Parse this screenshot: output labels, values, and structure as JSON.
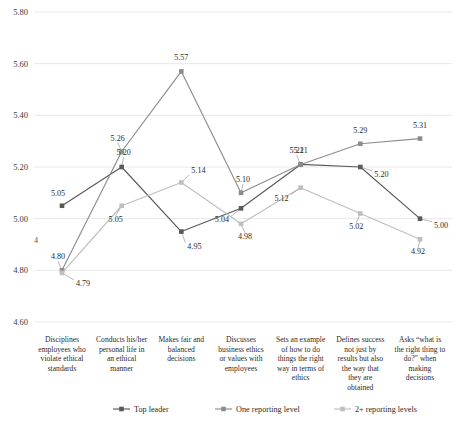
{
  "chart_data": {
    "type": "line",
    "title": "",
    "xlabel": "",
    "ylabel": "",
    "ylim": [
      4.6,
      5.8
    ],
    "ytick_step": 0.2,
    "yticks": [
      "4.60",
      "4.80",
      "5.00",
      "5.20",
      "5.40",
      "5.60",
      "5.80"
    ],
    "grid": true,
    "legend_position": "bottom",
    "categories": [
      "Disciplines employees who violate ethical standards",
      "Conducts his/her personal life in an ethical manner",
      "Makes fair and balanced decisions",
      "Discusses business ethics or values with employees",
      "Sets an example of how to do things the right way in terms of ethics",
      "Defines success not just by results but also the way that they are obtained",
      "Asks “what is the right thing to do?” when making decisions"
    ],
    "category_lines": [
      [
        "Disciplines",
        "employees who",
        "violate ethical",
        "standards"
      ],
      [
        "Conducts his/her",
        "personal life in",
        "an ethical",
        "manner"
      ],
      [
        "Makes fair and",
        "balanced",
        "decisions"
      ],
      [
        "Discusses",
        "business ethics",
        "or values with",
        "employees"
      ],
      [
        "Sets an example",
        "of how to do",
        "things the right",
        "way in terms of",
        "ethics"
      ],
      [
        "Defines success",
        "not just by",
        "results but also",
        "the way that",
        "they are",
        "obtained"
      ],
      [
        "Asks “what is",
        "the right thing to",
        "do?” when",
        "making",
        "decisions"
      ]
    ],
    "series": [
      {
        "name": "Top leader",
        "color": "#595959",
        "values": [
          5.05,
          5.2,
          4.95,
          5.04,
          5.21,
          5.2,
          5.0
        ],
        "labels": [
          "5.05",
          "5.20",
          "4.95",
          "5.04",
          "5.21",
          "5.20",
          "5.00"
        ]
      },
      {
        "name": "One reporting level",
        "color": "#8c8c8c",
        "values": [
          4.8,
          5.26,
          5.57,
          5.1,
          5.21,
          5.29,
          5.31
        ],
        "labels": [
          "4.80",
          "5.26",
          "5.57",
          "5.10",
          "5.21",
          "5.29",
          "5.31"
        ]
      },
      {
        "name": "2+ reporting levels",
        "color": "#bfbfbf",
        "values": [
          4.79,
          5.05,
          5.14,
          4.98,
          5.12,
          5.02,
          4.92
        ],
        "labels": [
          "4.79",
          "5.05",
          "5.14",
          "4.98",
          "5.12",
          "5.02",
          "4.92"
        ]
      }
    ],
    "stray_mark": "4"
  }
}
